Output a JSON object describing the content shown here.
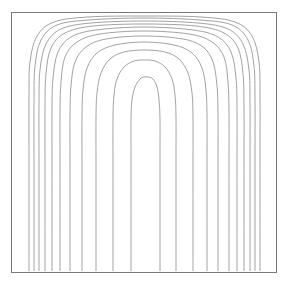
{
  "figure": {
    "name": "contour-plot",
    "background_color": "#ffffff",
    "line_color": "#8a8a8a",
    "frame_color": "#7a7a7a",
    "width": 289,
    "height": 285
  },
  "chart_data": {
    "type": "line",
    "title": "",
    "subtitle": "",
    "xlabel": "",
    "ylabel": "",
    "xlim": [
      0,
      1
    ],
    "ylim": [
      0,
      1
    ],
    "grid": false,
    "legend": null,
    "legend_position": "none",
    "annotations": [],
    "xticks": [],
    "yticks": [],
    "xticklabels": [],
    "yticklabels": [],
    "plot_area": {
      "x": 11,
      "y": 12,
      "width": 266,
      "height": 261
    },
    "contour_count": 11,
    "symmetry_axis_x": 144,
    "series": [
      {
        "name": "contour-1",
        "level": 1,
        "apex_y": 77,
        "half_width_bottom": 26,
        "points": [
          [
            131,
            271
          ],
          [
            131,
            160
          ],
          [
            131,
            120
          ],
          [
            132,
            100
          ],
          [
            135,
            87
          ],
          [
            140,
            79
          ],
          [
            144,
            77
          ],
          [
            148,
            77
          ],
          [
            153,
            79
          ],
          [
            157,
            87
          ],
          [
            159,
            100
          ],
          [
            160,
            120
          ],
          [
            160,
            160
          ],
          [
            160,
            271
          ]
        ]
      },
      {
        "name": "contour-2",
        "level": 2,
        "apex_y": 61,
        "half_width_bottom": 42,
        "points": [
          [
            113,
            271
          ],
          [
            113,
            165
          ],
          [
            113,
            118
          ],
          [
            114,
            95
          ],
          [
            117,
            79
          ],
          [
            124,
            67
          ],
          [
            134,
            61
          ],
          [
            144,
            60
          ],
          [
            155,
            61
          ],
          [
            165,
            67
          ],
          [
            172,
            79
          ],
          [
            175,
            95
          ],
          [
            176,
            118
          ],
          [
            176,
            165
          ],
          [
            176,
            271
          ]
        ]
      },
      {
        "name": "contour-3",
        "level": 3,
        "apex_y": 50,
        "half_width_bottom": 57,
        "points": [
          [
            96,
            271
          ],
          [
            96,
            168
          ],
          [
            96,
            118
          ],
          [
            97,
            93
          ],
          [
            101,
            73
          ],
          [
            110,
            59
          ],
          [
            124,
            52
          ],
          [
            144,
            50
          ],
          [
            165,
            52
          ],
          [
            179,
            59
          ],
          [
            188,
            73
          ],
          [
            192,
            93
          ],
          [
            193,
            118
          ],
          [
            193,
            168
          ],
          [
            193,
            271
          ]
        ]
      },
      {
        "name": "contour-4",
        "level": 4,
        "apex_y": 42,
        "half_width_bottom": 71,
        "points": [
          [
            82,
            271
          ],
          [
            82,
            170
          ],
          [
            82,
            117
          ],
          [
            83,
            90
          ],
          [
            87,
            68
          ],
          [
            97,
            53
          ],
          [
            115,
            45
          ],
          [
            144,
            42
          ],
          [
            174,
            45
          ],
          [
            192,
            53
          ],
          [
            202,
            68
          ],
          [
            206,
            90
          ],
          [
            207,
            117
          ],
          [
            207,
            170
          ],
          [
            207,
            271
          ]
        ]
      },
      {
        "name": "contour-5",
        "level": 5,
        "apex_y": 36,
        "half_width_bottom": 83,
        "points": [
          [
            70,
            271
          ],
          [
            70,
            172
          ],
          [
            70,
            115
          ],
          [
            71,
            86
          ],
          [
            75,
            62
          ],
          [
            86,
            47
          ],
          [
            106,
            39
          ],
          [
            144,
            36
          ],
          [
            183,
            39
          ],
          [
            203,
            47
          ],
          [
            213,
            62
          ],
          [
            217,
            86
          ],
          [
            218,
            115
          ],
          [
            218,
            172
          ],
          [
            218,
            271
          ]
        ]
      },
      {
        "name": "contour-6",
        "level": 6,
        "apex_y": 31,
        "half_width_bottom": 93,
        "points": [
          [
            60,
            271
          ],
          [
            60,
            172
          ],
          [
            60,
            113
          ],
          [
            61,
            82
          ],
          [
            65,
            57
          ],
          [
            77,
            42
          ],
          [
            100,
            34
          ],
          [
            144,
            31
          ],
          [
            189,
            34
          ],
          [
            212,
            42
          ],
          [
            224,
            57
          ],
          [
            228,
            82
          ],
          [
            229,
            113
          ],
          [
            229,
            172
          ],
          [
            229,
            271
          ]
        ]
      },
      {
        "name": "contour-7",
        "level": 7,
        "apex_y": 27,
        "half_width_bottom": 101,
        "points": [
          [
            52,
            271
          ],
          [
            52,
            172
          ],
          [
            52,
            110
          ],
          [
            53,
            78
          ],
          [
            58,
            52
          ],
          [
            71,
            37
          ],
          [
            96,
            30
          ],
          [
            144,
            27
          ],
          [
            193,
            30
          ],
          [
            218,
            37
          ],
          [
            231,
            52
          ],
          [
            236,
            78
          ],
          [
            237,
            110
          ],
          [
            237,
            172
          ],
          [
            237,
            271
          ]
        ]
      },
      {
        "name": "contour-8",
        "level": 8,
        "apex_y": 24,
        "half_width_bottom": 108,
        "points": [
          [
            45,
            271
          ],
          [
            45,
            170
          ],
          [
            45,
            107
          ],
          [
            46,
            74
          ],
          [
            51,
            48
          ],
          [
            65,
            33
          ],
          [
            93,
            26
          ],
          [
            144,
            24
          ],
          [
            196,
            26
          ],
          [
            224,
            33
          ],
          [
            238,
            48
          ],
          [
            243,
            74
          ],
          [
            244,
            107
          ],
          [
            244,
            170
          ],
          [
            244,
            271
          ]
        ]
      },
      {
        "name": "contour-9",
        "level": 9,
        "apex_y": 21,
        "half_width_bottom": 114,
        "points": [
          [
            39,
            271
          ],
          [
            39,
            168
          ],
          [
            39,
            104
          ],
          [
            40,
            70
          ],
          [
            46,
            44
          ],
          [
            61,
            29
          ],
          [
            91,
            23
          ],
          [
            144,
            21
          ],
          [
            198,
            23
          ],
          [
            228,
            29
          ],
          [
            243,
            44
          ],
          [
            249,
            70
          ],
          [
            250,
            104
          ],
          [
            250,
            168
          ],
          [
            250,
            271
          ]
        ]
      },
      {
        "name": "contour-10",
        "level": 10,
        "apex_y": 18,
        "half_width_bottom": 119,
        "points": [
          [
            34,
            271
          ],
          [
            34,
            165
          ],
          [
            34,
            100
          ],
          [
            35,
            66
          ],
          [
            41,
            40
          ],
          [
            57,
            25
          ],
          [
            89,
            20
          ],
          [
            144,
            18
          ],
          [
            200,
            20
          ],
          [
            232,
            25
          ],
          [
            248,
            40
          ],
          [
            254,
            66
          ],
          [
            255,
            100
          ],
          [
            255,
            165
          ],
          [
            255,
            271
          ]
        ]
      },
      {
        "name": "contour-11",
        "level": 11,
        "apex_y": 16,
        "half_width_bottom": 124,
        "points": [
          [
            29,
            271
          ],
          [
            29,
            162
          ],
          [
            29,
            96
          ],
          [
            30,
            62
          ],
          [
            37,
            36
          ],
          [
            54,
            22
          ],
          [
            88,
            17
          ],
          [
            144,
            16
          ],
          [
            201,
            17
          ],
          [
            235,
            22
          ],
          [
            252,
            36
          ],
          [
            259,
            62
          ],
          [
            260,
            96
          ],
          [
            260,
            162
          ],
          [
            260,
            271
          ]
        ]
      }
    ]
  }
}
